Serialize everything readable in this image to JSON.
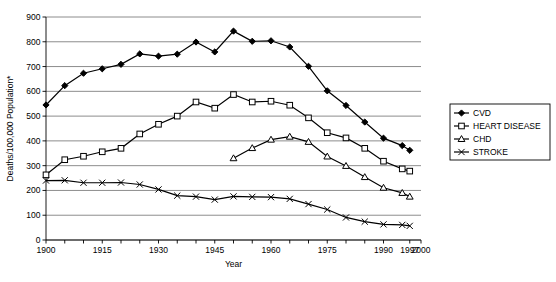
{
  "chart_data": {
    "type": "line",
    "title": "",
    "xlabel": "Year",
    "ylabel": "Deaths/100,000 Population*",
    "xlim": [
      1900,
      2000
    ],
    "ylim": [
      0,
      900
    ],
    "ytick_step": 100,
    "yticks": [
      0,
      100,
      200,
      300,
      400,
      500,
      600,
      700,
      800,
      900
    ],
    "xticks": [
      1900,
      1905,
      1910,
      1915,
      1920,
      1925,
      1930,
      1935,
      1940,
      1945,
      1950,
      1955,
      1960,
      1965,
      1970,
      1975,
      1980,
      1985,
      1990,
      1997,
      2000
    ],
    "xtick_labels": [
      "1900",
      "",
      "",
      "1915",
      "",
      "",
      "1930",
      "",
      "",
      "1945",
      "",
      "",
      "1960",
      "",
      "",
      "1975",
      "",
      "",
      "1990",
      "1997",
      "2000"
    ],
    "grid": "horizontal",
    "legend_position": "right-outside",
    "series": [
      {
        "name": "CVD",
        "marker": "filled-diamond",
        "x": [
          1900,
          1905,
          1910,
          1915,
          1920,
          1925,
          1930,
          1935,
          1940,
          1945,
          1950,
          1955,
          1960,
          1965,
          1970,
          1975,
          1980,
          1985,
          1990,
          1995,
          1997
        ],
        "values": [
          545,
          623,
          673,
          691,
          709,
          751,
          742,
          750,
          799,
          759,
          843,
          802,
          804,
          779,
          701,
          602,
          543,
          476,
          411,
          381,
          362
        ]
      },
      {
        "name": "HEART DISEASE",
        "marker": "open-square",
        "x": [
          1900,
          1905,
          1910,
          1915,
          1920,
          1925,
          1930,
          1935,
          1940,
          1945,
          1950,
          1955,
          1960,
          1965,
          1970,
          1975,
          1980,
          1985,
          1990,
          1995,
          1997
        ],
        "values": [
          263,
          324,
          338,
          356,
          370,
          428,
          467,
          500,
          557,
          532,
          587,
          557,
          560,
          544,
          493,
          433,
          412,
          370,
          318,
          287,
          278
        ]
      },
      {
        "name": "CHD",
        "marker": "open-triangle",
        "x": [
          1950,
          1955,
          1960,
          1965,
          1970,
          1975,
          1980,
          1985,
          1990,
          1995,
          1997
        ],
        "values": [
          330,
          371,
          405,
          417,
          396,
          337,
          299,
          254,
          211,
          190,
          175
        ]
      },
      {
        "name": "STROKE",
        "marker": "cross",
        "x": [
          1900,
          1905,
          1910,
          1915,
          1920,
          1925,
          1930,
          1935,
          1940,
          1945,
          1950,
          1955,
          1960,
          1965,
          1970,
          1975,
          1980,
          1985,
          1990,
          1995,
          1997
        ],
        "values": [
          240,
          241,
          231,
          231,
          232,
          224,
          204,
          179,
          175,
          163,
          176,
          174,
          173,
          166,
          145,
          123,
          91,
          74,
          63,
          61,
          57
        ]
      }
    ]
  },
  "legend": {
    "items": [
      {
        "label": "CVD"
      },
      {
        "label": "HEART DISEASE"
      },
      {
        "label": "CHD"
      },
      {
        "label": "STROKE"
      }
    ]
  }
}
